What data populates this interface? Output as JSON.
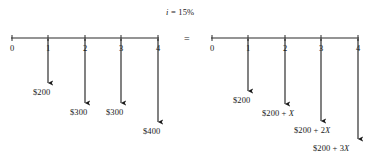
{
  "figure": {
    "title": "i = 15%",
    "title_parts": {
      "symbol": "i",
      "rest": " = 15%"
    },
    "equals_sign": "=",
    "colors": {
      "ink": "#1a1a1a",
      "axis": "#2b2b2b",
      "background": "#ffffff"
    },
    "diagrams": [
      {
        "id": "left-cash-flow-diagram",
        "name": "actual-payment-series",
        "axis": {
          "x_start": 11,
          "x_end": 159,
          "y": 38
        },
        "tick_labels": [
          "0",
          "1",
          "2",
          "3",
          "4"
        ],
        "tick_x": [
          12,
          48,
          85,
          121,
          158
        ],
        "arrows": [
          {
            "period": "1",
            "label": "$200",
            "x": 48,
            "y_start": 39,
            "y_end": 83,
            "label_x": 33,
            "label_y": 88
          },
          {
            "period": "2",
            "label": "$300",
            "x": 85,
            "y_start": 39,
            "y_end": 103,
            "label_x": 70,
            "label_y": 108
          },
          {
            "period": "3",
            "label": "$300",
            "x": 121,
            "y_start": 39,
            "y_end": 103,
            "label_x": 106,
            "label_y": 108
          },
          {
            "period": "4",
            "label": "$400",
            "x": 158,
            "y_start": 39,
            "y_end": 122,
            "label_x": 143,
            "label_y": 127
          }
        ]
      },
      {
        "id": "right-cash-flow-diagram",
        "name": "equivalent-gradient-series",
        "axis": {
          "x_start": 211,
          "x_end": 359,
          "y": 38
        },
        "tick_labels": [
          "0",
          "1",
          "2",
          "3",
          "4"
        ],
        "tick_x": [
          212,
          248,
          285,
          321,
          358
        ],
        "arrows": [
          {
            "period": "1",
            "label": "$200",
            "label_prefix": "$200",
            "label_suffix": "",
            "x": 248,
            "y_start": 39,
            "y_end": 91,
            "label_x": 233,
            "label_y": 96
          },
          {
            "period": "2",
            "label": "$200 + X",
            "label_prefix": "$200 + ",
            "label_suffix": "X",
            "x": 285,
            "y_start": 39,
            "y_end": 104,
            "label_x": 262,
            "label_y": 109
          },
          {
            "period": "3",
            "label": "$200 + 2X",
            "label_prefix": "$200 + 2",
            "label_suffix": "X",
            "x": 321,
            "y_start": 39,
            "y_end": 121,
            "label_x": 294,
            "label_y": 126
          },
          {
            "period": "4",
            "label": "$200 + 3X",
            "label_prefix": "$200 + 3",
            "label_suffix": "X",
            "x": 358,
            "y_start": 39,
            "y_end": 139,
            "label_x": 313,
            "label_y": 144
          }
        ]
      }
    ]
  },
  "chart_data": {
    "type": "bar",
    "title": "i = 15%",
    "xlabel": "Period",
    "ylabel": "Cash flow (outflow)",
    "categories": [
      "0",
      "1",
      "2",
      "3",
      "4"
    ],
    "grid": false,
    "legend": "none",
    "annotations": [
      "i = 15%",
      "="
    ],
    "series": [
      {
        "name": "Actual payment series",
        "labels": [
          "",
          "$200",
          "$300",
          "$300",
          "$400"
        ],
        "values": [
          0,
          200,
          300,
          300,
          400
        ]
      },
      {
        "name": "Equivalent gradient series",
        "labels": [
          "",
          "$200",
          "$200 + X",
          "$200 + 2X",
          "$200 + 3X"
        ],
        "values": [
          0,
          200,
          null,
          null,
          null
        ]
      }
    ]
  }
}
